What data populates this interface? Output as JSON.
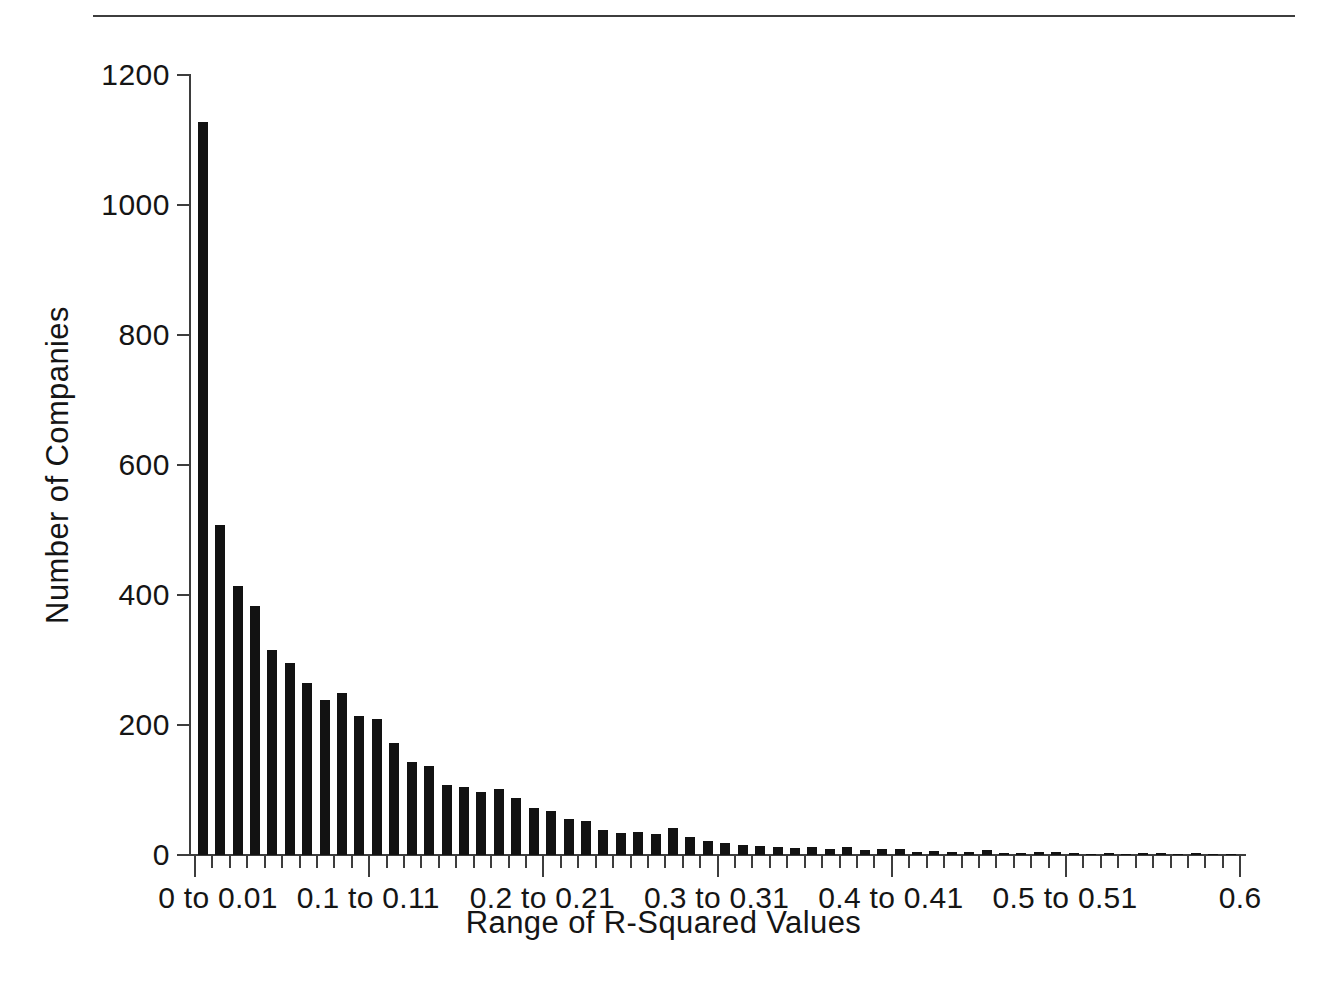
{
  "chart_data": {
    "type": "bar",
    "title": "",
    "xlabel": "Range of R-Squared Values",
    "ylabel": "Number of Companies",
    "grid": false,
    "legend": false,
    "ylim": [
      0,
      1200
    ],
    "ytick_labels": [
      "0",
      "200",
      "400",
      "600",
      "800",
      "1000",
      "1200"
    ],
    "ytick_values": [
      0,
      200,
      400,
      600,
      800,
      1000,
      1200
    ],
    "xtick_labels": [
      "0 to 0.01",
      "0.1 to 0.11",
      "0.2 to 0.21",
      "0.3 to 0.31",
      "0.4 to 0.41",
      "0.5 to 0.51",
      "0.6"
    ],
    "xtick_bin_index": [
      0,
      10,
      20,
      30,
      40,
      50,
      60
    ],
    "bin_width": 0.01,
    "x_start": 0,
    "x_end": 0.6,
    "n_bins": 60,
    "categories": [
      "0 to 0.01",
      "0.01 to 0.02",
      "0.02 to 0.03",
      "0.03 to 0.04",
      "0.04 to 0.05",
      "0.05 to 0.06",
      "0.06 to 0.07",
      "0.07 to 0.08",
      "0.08 to 0.09",
      "0.09 to 0.1",
      "0.1 to 0.11",
      "0.11 to 0.12",
      "0.12 to 0.13",
      "0.13 to 0.14",
      "0.14 to 0.15",
      "0.15 to 0.16",
      "0.16 to 0.17",
      "0.17 to 0.18",
      "0.18 to 0.19",
      "0.19 to 0.2",
      "0.2 to 0.21",
      "0.21 to 0.22",
      "0.22 to 0.23",
      "0.23 to 0.24",
      "0.24 to 0.25",
      "0.25 to 0.26",
      "0.26 to 0.27",
      "0.27 to 0.28",
      "0.28 to 0.29",
      "0.29 to 0.3",
      "0.3 to 0.31",
      "0.31 to 0.32",
      "0.32 to 0.33",
      "0.33 to 0.34",
      "0.34 to 0.35",
      "0.35 to 0.36",
      "0.36 to 0.37",
      "0.37 to 0.38",
      "0.38 to 0.39",
      "0.39 to 0.4",
      "0.4 to 0.41",
      "0.41 to 0.42",
      "0.42 to 0.43",
      "0.43 to 0.44",
      "0.44 to 0.45",
      "0.45 to 0.46",
      "0.46 to 0.47",
      "0.47 to 0.48",
      "0.48 to 0.49",
      "0.49 to 0.5",
      "0.5 to 0.51",
      "0.51 to 0.52",
      "0.52 to 0.53",
      "0.53 to 0.54",
      "0.54 to 0.55",
      "0.55 to 0.56",
      "0.56 to 0.57",
      "0.57 to 0.58",
      "0.58 to 0.59",
      "0.59 to 0.6"
    ],
    "values": [
      1128,
      508,
      414,
      383,
      315,
      296,
      265,
      239,
      250,
      214,
      210,
      173,
      143,
      137,
      107,
      105,
      97,
      101,
      88,
      73,
      67,
      55,
      52,
      38,
      34,
      36,
      33,
      42,
      27,
      22,
      18,
      16,
      14,
      13,
      11,
      12,
      9,
      13,
      8,
      9,
      10,
      4,
      6,
      5,
      5,
      7,
      3,
      3,
      4,
      4,
      3,
      2,
      3,
      2,
      3,
      3,
      2,
      3,
      2,
      2
    ],
    "bar_color": "#121212",
    "axis_color": "#3d3d3d"
  }
}
